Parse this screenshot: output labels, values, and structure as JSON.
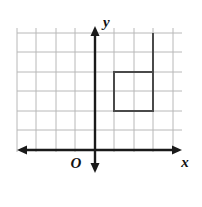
{
  "figure": {
    "background_color": "#ffffff",
    "width": 202,
    "height": 207
  },
  "axes": {
    "x_axis": {
      "label": "x",
      "label_x": 185,
      "label_y": 167,
      "y_position": 150,
      "x_start": 17,
      "x_end": 182,
      "color": "#1a1a1a",
      "arrow_left": true,
      "arrow_right": true
    },
    "y_axis": {
      "label": "y",
      "label_x": 103,
      "label_y": 27,
      "x_position": 95,
      "y_start": 26,
      "y_end": 173,
      "color": "#1a1a1a",
      "arrow_up": true,
      "arrow_down": true
    },
    "origin": {
      "label": "O",
      "label_x": 76,
      "label_y": 168
    }
  },
  "grid": {
    "color": "#b8b8b8",
    "line_width": 1,
    "spacing": 19.6,
    "x_lines": [
      17,
      36,
      56,
      75,
      95,
      114,
      134,
      153,
      173
    ],
    "y_lines": [
      33,
      52,
      72,
      91,
      111,
      130,
      150
    ],
    "x_extent": [
      17,
      182
    ],
    "y_extent": [
      28,
      152
    ]
  },
  "shapes": [
    {
      "name": "square",
      "type": "rect",
      "x": 114,
      "y": 72,
      "width": 39,
      "height": 39,
      "stroke": "#4a4a4a",
      "stroke_width": 2,
      "fill": "none",
      "grid_cells_wide": 2,
      "grid_cells_tall": 2
    },
    {
      "name": "vertical-segment",
      "type": "line",
      "x1": 153,
      "y1": 33,
      "x2": 153,
      "y2": 72,
      "stroke": "#4a4a4a",
      "stroke_width": 2
    }
  ],
  "colors": {
    "grid": "#b8b8b8",
    "axis": "#1a1a1a",
    "shape": "#4a4a4a",
    "background": "#ffffff"
  }
}
